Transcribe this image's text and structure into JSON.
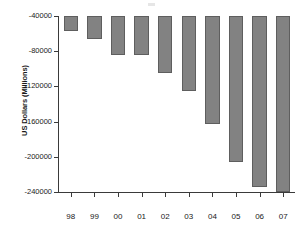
{
  "chart_data": {
    "type": "bar",
    "title": "",
    "subtitle": "",
    "xlabel": "",
    "ylabel": "US Dollars (Millions)",
    "categories": [
      "98",
      "99",
      "00",
      "01",
      "02",
      "03",
      "04",
      "05",
      "06",
      "07"
    ],
    "values": [
      -57000,
      -66000,
      -84000,
      -84000,
      -105000,
      -125000,
      -163000,
      -206000,
      -234000,
      -240000
    ],
    "ylim": [
      -240000,
      -40000
    ],
    "yticks": [
      -40000,
      -80000,
      -120000,
      -160000,
      -200000,
      -240000
    ],
    "ytick_labels": [
      "-40000",
      "-80000",
      "-120000",
      "-160000",
      "-200000",
      "-240000"
    ],
    "grid": false,
    "legend": null,
    "bar_color": "#828282",
    "bar_edge_color": "#5e5e5e",
    "axis_color": "#3a3a3a",
    "background": "#ffffff",
    "orientation": "vertical",
    "baseline": -40000,
    "note": "Bars hang downward from the top axis (-40000); values are negative."
  }
}
